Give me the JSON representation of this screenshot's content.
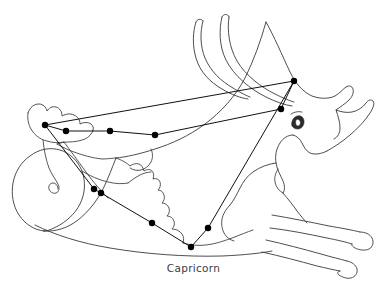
{
  "figure": {
    "caption": "Capricorn",
    "background_color": "#ffffff",
    "outline_color": "#3a3a3a",
    "star_color": "#000000",
    "line_color": "#111111",
    "caption_color": "#3c3c3c",
    "width": 387,
    "height": 291
  },
  "chart_data": {
    "type": "scatter",
    "title": "Capricorn",
    "xlabel": "",
    "ylabel": "",
    "xlim": [
      0,
      387
    ],
    "ylim": [
      291,
      0
    ],
    "grid": false,
    "legend": "none",
    "stars": [
      {
        "id": "s1",
        "x": 45,
        "y": 125
      },
      {
        "id": "s2",
        "x": 66,
        "y": 131
      },
      {
        "id": "s3",
        "x": 110,
        "y": 131
      },
      {
        "id": "s4",
        "x": 155,
        "y": 135
      },
      {
        "id": "s5",
        "x": 294,
        "y": 81
      },
      {
        "id": "s6",
        "x": 281,
        "y": 109
      },
      {
        "id": "s7",
        "x": 94,
        "y": 189
      },
      {
        "id": "s8",
        "x": 101,
        "y": 193
      },
      {
        "id": "s9",
        "x": 152,
        "y": 223
      },
      {
        "id": "s10",
        "x": 191,
        "y": 247
      },
      {
        "id": "s11",
        "x": 208,
        "y": 228
      }
    ],
    "lines": [
      [
        "s1",
        "s2"
      ],
      [
        "s2",
        "s3"
      ],
      [
        "s3",
        "s4"
      ],
      [
        "s4",
        "s6"
      ],
      [
        "s6",
        "s5"
      ],
      [
        "s5",
        "s1"
      ],
      [
        "s1",
        "s7"
      ],
      [
        "s7",
        "s8"
      ],
      [
        "s8",
        "s9"
      ],
      [
        "s9",
        "s10"
      ],
      [
        "s10",
        "s11"
      ],
      [
        "s11",
        "s5"
      ]
    ]
  }
}
